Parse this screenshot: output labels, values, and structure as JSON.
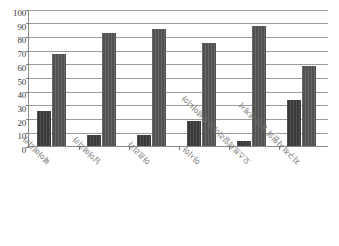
{
  "chart_data": {
    "type": "bar",
    "title": "",
    "subtitle": "",
    "xlabel": "",
    "ylabel": "",
    "ylim": [
      0,
      100
    ],
    "y_ticks": [
      0,
      10,
      20,
      30,
      40,
      50,
      60,
      70,
      80,
      90,
      100
    ],
    "y_tick_labels": [
      "0",
      "10",
      "20",
      "30",
      "40",
      "50",
      "60",
      "70",
      "80",
      "90",
      "100"
    ],
    "grid": true,
    "legend": false,
    "legend_position": "none",
    "orientation": "rotated-180",
    "categories": [
      "북아메리카",
      "남아메리카",
      "아프리카",
      "아시아",
      "오스트레일리아와 오세아니아",
      "지구적 자원의 발전/세계서"
    ],
    "series": [
      {
        "name": "series-1",
        "color": "#3a3a3a",
        "values": [
          25,
          8,
          8,
          18,
          3,
          33
        ]
      },
      {
        "name": "series-2",
        "color": "#515151",
        "values": [
          67,
          82,
          85,
          75,
          87,
          58
        ]
      }
    ]
  },
  "figure": {
    "background": "#ffffff",
    "axis_color": "#8a8a8a",
    "gridline_color": "#9d9d9d",
    "tick_label_color": "#3a3a3a",
    "category_label_color": "#6f6f6f"
  }
}
